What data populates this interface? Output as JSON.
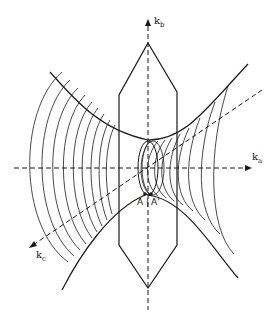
{
  "figure": {
    "type": "3D reciprocal-space surface diagram (hyperboloid with cross-sectional contours)",
    "axes": [
      {
        "id": "kb",
        "label": "k",
        "subscript": "b",
        "direction": "vertical (up)"
      },
      {
        "id": "ka",
        "label": "k",
        "subscript": "a",
        "direction": "horizontal (right)"
      },
      {
        "id": "kc",
        "label": "k",
        "subscript": "c",
        "direction": "diagonal (toward lower-left)"
      }
    ],
    "points": [
      {
        "id": "A",
        "label": "A"
      },
      {
        "id": "A_prime",
        "label": "A'"
      }
    ],
    "separator": "|",
    "colors": {
      "line": "#1a1a1a",
      "background": "#ffffff"
    }
  }
}
